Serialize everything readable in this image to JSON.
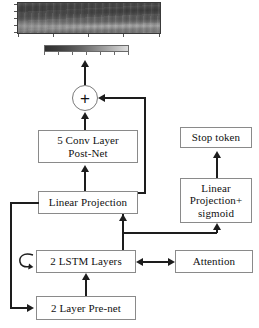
{
  "diagram": {
    "nodes": {
      "sum": "+",
      "postnet": "5 Conv Layer\nPost-Net",
      "postnet_line1": "5 Conv Layer",
      "postnet_line2": "Post-Net",
      "linear_projection": "Linear Projection",
      "lstm": "2 LSTM Layers",
      "prenet": "2 Layer Pre-net",
      "stop_token": "Stop token",
      "linear_sigmoid_line1": "Linear",
      "linear_sigmoid_line2": "Projection+",
      "linear_sigmoid_line3": "sigmoid",
      "attention": "Attention"
    },
    "spectrogram": {
      "name": "mel-spectrogram",
      "y_tick_count": 5,
      "x_tick_count": 5,
      "colorbar_tick_count": 7,
      "colorbar_low_color": "#2f2f2f",
      "colorbar_high_color": "#dedede"
    },
    "edges": [
      {
        "name": "postnet-to-sum",
        "from": "postnet",
        "to": "sum",
        "type": "arrow-up"
      },
      {
        "name": "sum-to-spectrogram",
        "from": "sum",
        "to": "spectrogram",
        "type": "arrow-up"
      },
      {
        "name": "linear-projection-to-postnet",
        "from": "linear_projection",
        "to": "postnet",
        "type": "arrow-up"
      },
      {
        "name": "linear-projection-residual-to-sum",
        "from": "linear_projection",
        "to": "sum",
        "type": "arrow-left"
      },
      {
        "name": "lstm-to-linear-projection",
        "from": "lstm",
        "to": "linear_projection",
        "type": "arrow-up"
      },
      {
        "name": "prenet-to-lstm",
        "from": "prenet",
        "to": "lstm",
        "type": "arrow-up"
      },
      {
        "name": "linear-projection-feedback-to-prenet",
        "from": "linear_projection",
        "to": "prenet",
        "type": "arrow-right"
      },
      {
        "name": "lstm-attention-bidirectional",
        "from": "lstm",
        "to": "attention",
        "type": "arrow-both"
      },
      {
        "name": "lstm-to-linear-sigmoid",
        "from": "lstm",
        "to": "linear_sigmoid",
        "type": "arrow-up"
      },
      {
        "name": "linear-sigmoid-to-stop-token",
        "from": "linear_sigmoid",
        "to": "stop_token",
        "type": "arrow-up"
      },
      {
        "name": "lstm-self-loop",
        "from": "lstm",
        "to": "lstm",
        "type": "self-loop"
      }
    ],
    "colors": {
      "line": "#1d1d1d",
      "box_border": "#8a8a8a",
      "text": "#111111",
      "background": "#ffffff"
    }
  }
}
